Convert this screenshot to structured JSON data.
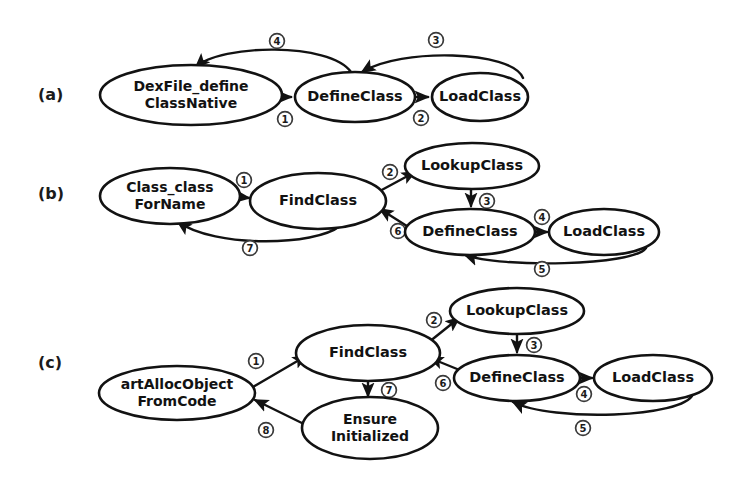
{
  "figure": {
    "background_color": "#ffffff",
    "stroke_color": "#121212",
    "panels": [
      {
        "id": "a",
        "label": "(a)",
        "label_x": 38,
        "label_y": 100,
        "nodes": [
          {
            "id": "a-dexfile",
            "name": "dexfile-define-class-native",
            "lines": [
              "DexFile_define",
              "ClassNative"
            ],
            "cx": 191,
            "cy": 95,
            "rx": 91,
            "ry": 30
          },
          {
            "id": "a-define",
            "name": "define-class",
            "lines": [
              "DefineClass"
            ],
            "cx": 355,
            "cy": 97,
            "rx": 60,
            "ry": 25
          },
          {
            "id": "a-load",
            "name": "load-class",
            "lines": [
              "LoadClass"
            ],
            "cx": 480,
            "cy": 97,
            "rx": 48,
            "ry": 24
          }
        ],
        "edges": [
          {
            "id": "a-e1",
            "name": "edge-dexfile-to-defineclass",
            "from": "a-dexfile",
            "to": "a-define",
            "label": "1",
            "label_x": 285,
            "label_y": 119,
            "d": "M 283 97 L 291 97"
          },
          {
            "id": "a-e2",
            "name": "edge-defineclass-to-loadclass",
            "from": "a-define",
            "to": "a-load",
            "label": "2",
            "label_x": 421,
            "label_y": 118,
            "d": "M 416 97 L 428 97"
          },
          {
            "id": "a-e3",
            "name": "edge-loadclass-to-defineclass",
            "from": "a-load",
            "to": "a-define",
            "label": "3",
            "label_x": 436,
            "label_y": 40,
            "d": "M 523 78 C 512 50 400 48 362 72"
          },
          {
            "id": "a-e4",
            "name": "edge-defineclass-to-dexfile",
            "from": "a-define",
            "to": "a-dexfile",
            "label": "4",
            "label_x": 277,
            "label_y": 41,
            "d": "M 351 72 C 330 42 220 44 196 67"
          }
        ]
      },
      {
        "id": "b",
        "label": "(b)",
        "label_x": 38,
        "label_y": 199,
        "nodes": [
          {
            "id": "b-forname",
            "name": "class-class-for-name",
            "lines": [
              "Class_class",
              "ForName"
            ],
            "cx": 170,
            "cy": 196,
            "rx": 70,
            "ry": 28
          },
          {
            "id": "b-find",
            "name": "find-class",
            "lines": [
              "FindClass"
            ],
            "cx": 318,
            "cy": 201,
            "rx": 68,
            "ry": 28
          },
          {
            "id": "b-lookup",
            "name": "lookup-class",
            "lines": [
              "LookupClass"
            ],
            "cx": 472,
            "cy": 166,
            "rx": 67,
            "ry": 23
          },
          {
            "id": "b-define",
            "name": "define-class",
            "lines": [
              "DefineClass"
            ],
            "cx": 470,
            "cy": 232,
            "rx": 65,
            "ry": 23
          },
          {
            "id": "b-load",
            "name": "load-class",
            "lines": [
              "LoadClass"
            ],
            "cx": 604,
            "cy": 232,
            "rx": 55,
            "ry": 23
          }
        ],
        "edges": [
          {
            "id": "b-e1",
            "name": "edge-forname-to-findclass",
            "from": "b-forname",
            "to": "b-find",
            "label": "1",
            "label_x": 244,
            "label_y": 180,
            "d": "M 241 197 L 249 198"
          },
          {
            "id": "b-e2",
            "name": "edge-findclass-to-lookupclass",
            "from": "b-find",
            "to": "b-lookup",
            "label": "2",
            "label_x": 390,
            "label_y": 172,
            "d": "M 378 192 L 415 172"
          },
          {
            "id": "b-e3",
            "name": "edge-lookupclass-to-defineclass",
            "from": "b-lookup",
            "to": "b-define",
            "label": "3",
            "label_x": 487,
            "label_y": 201,
            "d": "M 471 190 L 471 206"
          },
          {
            "id": "b-e4",
            "name": "edge-defineclass-to-loadclass",
            "from": "b-define",
            "to": "b-load",
            "label": "4",
            "label_x": 542,
            "label_y": 217,
            "d": "M 536 232 L 547 232"
          },
          {
            "id": "b-e5",
            "name": "edge-loadclass-to-defineclass",
            "from": "b-load",
            "to": "b-define",
            "label": "5",
            "label_x": 542,
            "label_y": 269,
            "d": "M 646 248 C 634 266 500 268 465 255"
          },
          {
            "id": "b-e6",
            "name": "edge-defineclass-to-findclass",
            "from": "b-define",
            "to": "b-find",
            "label": "6",
            "label_x": 398,
            "label_y": 231,
            "d": "M 410 228 L 380 209"
          },
          {
            "id": "b-e7",
            "name": "edge-findclass-to-forname",
            "from": "b-find",
            "to": "b-forname",
            "label": "7",
            "label_x": 250,
            "label_y": 248,
            "d": "M 340 226 C 315 246 215 248 178 222"
          }
        ]
      },
      {
        "id": "c",
        "label": "(c)",
        "label_x": 38,
        "label_y": 368,
        "nodes": [
          {
            "id": "c-alloc",
            "name": "art-alloc-object-from-code",
            "lines": [
              "artAllocObject",
              "FromCode"
            ],
            "cx": 177,
            "cy": 393,
            "rx": 78,
            "ry": 27
          },
          {
            "id": "c-find",
            "name": "find-class",
            "lines": [
              "FindClass"
            ],
            "cx": 368,
            "cy": 353,
            "rx": 72,
            "ry": 28
          },
          {
            "id": "c-ensure",
            "name": "ensure-initialized",
            "lines": [
              "Ensure",
              "Initialized"
            ],
            "cx": 370,
            "cy": 428,
            "rx": 68,
            "ry": 31
          },
          {
            "id": "c-lookup",
            "name": "lookup-class",
            "lines": [
              "LookupClass"
            ],
            "cx": 517,
            "cy": 311,
            "rx": 67,
            "ry": 23
          },
          {
            "id": "c-define",
            "name": "define-class",
            "lines": [
              "DefineClass"
            ],
            "cx": 517,
            "cy": 378,
            "rx": 63,
            "ry": 23
          },
          {
            "id": "c-load",
            "name": "load-class",
            "lines": [
              "LoadClass"
            ],
            "cx": 653,
            "cy": 378,
            "rx": 59,
            "ry": 23
          }
        ],
        "edges": [
          {
            "id": "c-e1",
            "name": "edge-alloc-to-findclass",
            "from": "c-alloc",
            "to": "c-find",
            "label": "1",
            "label_x": 256,
            "label_y": 361,
            "d": "M 253 387 L 306 356"
          },
          {
            "id": "c-e2",
            "name": "edge-findclass-to-lookupclass",
            "from": "c-find",
            "to": "c-lookup",
            "label": "2",
            "label_x": 434,
            "label_y": 320,
            "d": "M 429 342 L 459 318"
          },
          {
            "id": "c-e3",
            "name": "edge-lookupclass-to-defineclass",
            "from": "c-lookup",
            "to": "c-define",
            "label": "3",
            "label_x": 534,
            "label_y": 345,
            "d": "M 517 335 L 517 352"
          },
          {
            "id": "c-e4",
            "name": "edge-defineclass-to-loadclass",
            "from": "c-define",
            "to": "c-load",
            "label": "4",
            "label_x": 584,
            "label_y": 394,
            "d": "M 581 378 L 592 378"
          },
          {
            "id": "c-e5",
            "name": "edge-loadclass-to-defineclass",
            "from": "c-load",
            "to": "c-define",
            "label": "5",
            "label_x": 583,
            "label_y": 428,
            "d": "M 693 394 C 684 418 552 422 513 402"
          },
          {
            "id": "c-e6",
            "name": "edge-defineclass-to-findclass",
            "from": "c-define",
            "to": "c-find",
            "label": "6",
            "label_x": 443,
            "label_y": 383,
            "d": "M 462 371 L 430 358"
          },
          {
            "id": "c-e7",
            "name": "edge-findclass-to-ensureinitialized",
            "from": "c-find",
            "to": "c-ensure",
            "label": "7",
            "label_x": 389,
            "label_y": 390,
            "d": "M 368 382 L 368 396"
          },
          {
            "id": "c-e8",
            "name": "edge-ensureinitialized-to-alloc",
            "from": "c-ensure",
            "to": "c-alloc",
            "label": "8",
            "label_x": 266,
            "label_y": 430,
            "d": "M 310 427 L 255 400"
          }
        ]
      }
    ]
  }
}
